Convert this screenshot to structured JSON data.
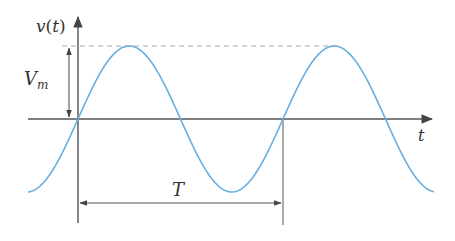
{
  "diagram": {
    "type": "sinusoidal-waveform",
    "colors": {
      "curve": "#6aaede",
      "axis": "#444444",
      "dashed": "#aaaaaa",
      "annotation": "#555555",
      "text": "#333333"
    },
    "labels": {
      "y_axis": "v(t)",
      "y_axis_var": "v",
      "y_axis_paren_open": "(",
      "y_axis_arg": "t",
      "y_axis_paren_close": ")",
      "x_axis": "t",
      "amplitude": "V",
      "amplitude_subscript": "m",
      "period": "T"
    },
    "geometry": {
      "origin_x": 78,
      "axis_y": 119,
      "amplitude_px": 73,
      "period_px": 205,
      "x_start": 28,
      "x_end": 434
    }
  }
}
